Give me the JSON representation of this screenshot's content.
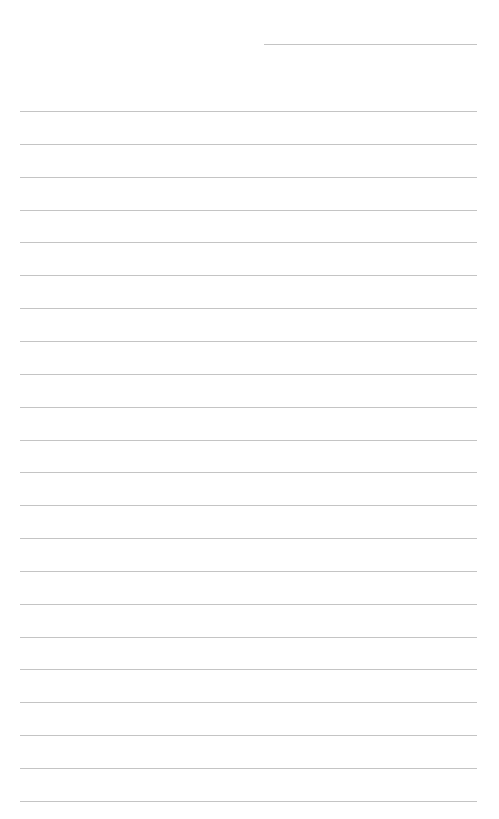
{
  "page": {
    "type": "lined-note-sheet",
    "background_color": "#ffffff",
    "line_color": "#c4c4c4"
  },
  "header_line": {
    "left": 264,
    "right": 477,
    "top": 44,
    "label": ""
  },
  "ruled_lines": {
    "left": 20,
    "right": 477,
    "first_top": 111,
    "pitch": 32.85,
    "count": 22,
    "entries": [
      "",
      "",
      "",
      "",
      "",
      "",
      "",
      "",
      "",
      "",
      "",
      "",
      "",
      "",
      "",
      "",
      "",
      "",
      "",
      "",
      "",
      ""
    ]
  }
}
